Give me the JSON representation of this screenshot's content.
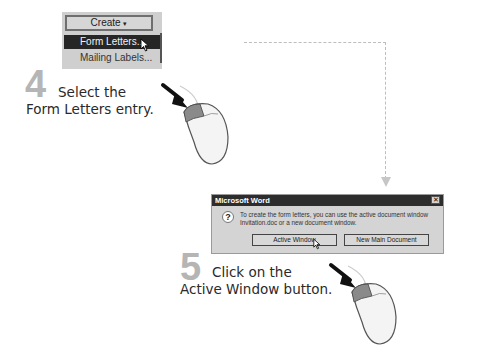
{
  "step4": {
    "number": "4",
    "line1": "Select the",
    "line2": "Form Letters entry.",
    "menu": {
      "button_label": "Create",
      "button_arrow": "▾",
      "items": [
        {
          "label": "Form Letters...",
          "highlighted": true
        },
        {
          "label": "Mailing Labels...",
          "highlighted": false
        }
      ]
    }
  },
  "step5": {
    "number": "5",
    "line1": "Click on the",
    "line2": "Active Window button.",
    "dialog": {
      "title": "Microsoft Word",
      "close_glyph": "✕",
      "icon": "?",
      "message": "To create the form letters, you can use the active document window Invitation.doc or a new document window.",
      "buttons": [
        {
          "label": "Active Window"
        },
        {
          "label": "New Main Document"
        }
      ]
    }
  },
  "colors": {
    "step_number": "#b5b5b5",
    "highlight": "#262626",
    "dialog_bg": "#d4d4d4",
    "mouse_button": "#8a8a8a"
  }
}
